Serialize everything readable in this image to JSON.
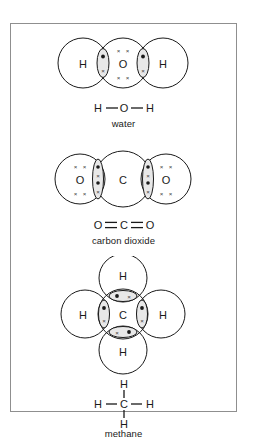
{
  "figure": {
    "border_color": "#8f8f8f",
    "background": "#ffffff",
    "line_color": "#1a1a1a",
    "lens_fill": "#e8e8e8"
  },
  "molecules": [
    {
      "id": "water",
      "caption": "water",
      "formula_atoms": [
        "H",
        "O",
        "H"
      ],
      "formula_bonds": [
        "single",
        "single"
      ],
      "shells": [
        {
          "label": "H",
          "cx": 45,
          "cy": 33,
          "r": 25
        },
        {
          "label": "O",
          "cx": 85,
          "cy": 33,
          "r": 25
        },
        {
          "label": "H",
          "cx": 125,
          "cy": 33,
          "r": 25
        }
      ],
      "lone_pairs": [
        {
          "atom": "O",
          "marks": "x x",
          "position": "above"
        },
        {
          "atom": "O",
          "marks": "x x",
          "position": "below"
        }
      ],
      "bond_regions": [
        {
          "between": [
            "H",
            "O"
          ],
          "orientation": "vertical",
          "electrons": [
            "dot",
            "cross"
          ]
        },
        {
          "between": [
            "O",
            "H"
          ],
          "orientation": "vertical",
          "electrons": [
            "dot",
            "cross"
          ]
        }
      ]
    },
    {
      "id": "carbon-dioxide",
      "caption": "carbon dioxide",
      "formula_atoms": [
        "O",
        "C",
        "O"
      ],
      "formula_bonds": [
        "double",
        "double"
      ],
      "shells": [
        {
          "label": "O",
          "cx": 42,
          "cy": 34,
          "r": 25
        },
        {
          "label": "C",
          "cx": 85,
          "cy": 34,
          "r": 28
        },
        {
          "label": "O",
          "cx": 128,
          "cy": 34,
          "r": 25
        }
      ],
      "lone_pairs": [
        {
          "atom": "O-left",
          "marks": "x x",
          "position": "above"
        },
        {
          "atom": "O-left",
          "marks": "x x",
          "position": "below"
        },
        {
          "atom": "O-right",
          "marks": "x x",
          "position": "above"
        },
        {
          "atom": "O-right",
          "marks": "x x",
          "position": "below"
        }
      ],
      "bond_regions": [
        {
          "between": [
            "O",
            "C"
          ],
          "orientation": "vertical",
          "electrons": [
            "dot",
            "cross",
            "dot",
            "cross"
          ]
        },
        {
          "between": [
            "C",
            "O"
          ],
          "orientation": "vertical",
          "electrons": [
            "dot",
            "cross",
            "dot",
            "cross"
          ]
        }
      ]
    },
    {
      "id": "methane",
      "caption": "methane",
      "formula_atoms": [
        "H",
        "H",
        "C",
        "H",
        "H"
      ],
      "formula_bonds": [
        "single",
        "single",
        "single",
        "single"
      ],
      "shells": [
        {
          "label": "H",
          "cx": 85,
          "cy": 22,
          "r": 24
        },
        {
          "label": "H",
          "cx": 47,
          "cy": 58,
          "r": 24
        },
        {
          "label": "C",
          "cx": 85,
          "cy": 58,
          "r": 25
        },
        {
          "label": "H",
          "cx": 123,
          "cy": 58,
          "r": 24
        },
        {
          "label": "H",
          "cx": 85,
          "cy": 94,
          "r": 24
        }
      ],
      "bond_regions": [
        {
          "between": [
            "C",
            "H-top"
          ],
          "orientation": "horizontal",
          "electrons": [
            "dot",
            "cross"
          ]
        },
        {
          "between": [
            "H-left",
            "C"
          ],
          "orientation": "vertical",
          "electrons": [
            "dot",
            "cross"
          ]
        },
        {
          "between": [
            "C",
            "H-right"
          ],
          "orientation": "vertical",
          "electrons": [
            "dot",
            "cross"
          ]
        },
        {
          "between": [
            "C",
            "H-bottom"
          ],
          "orientation": "horizontal",
          "electrons": [
            "cross",
            "dot"
          ]
        }
      ]
    }
  ],
  "electron_symbols": {
    "shared_dot": "•",
    "shared_cross": "×",
    "lone_pair": "× ×"
  }
}
